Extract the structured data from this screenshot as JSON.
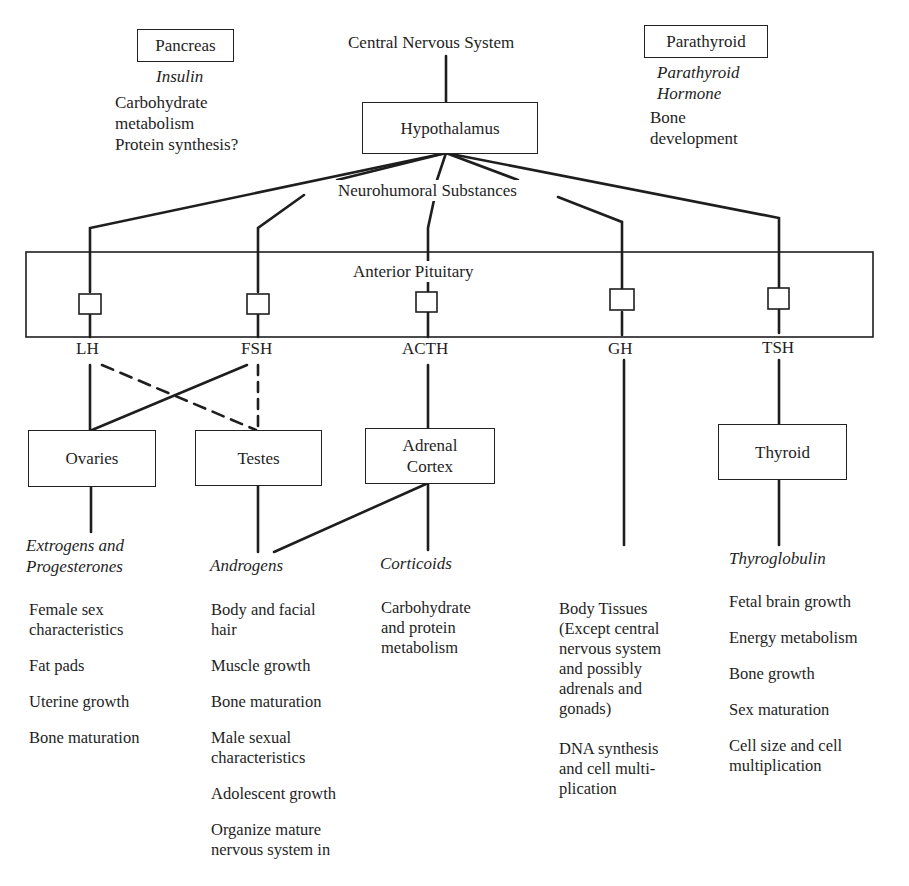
{
  "top": {
    "cns": "Central Nervous System",
    "hypothalamus": "Hypothalamus",
    "neurohumoral": "Neurohumoral Substances",
    "anterior_pituitary": "Anterior Pituitary"
  },
  "pancreas": {
    "box": "Pancreas",
    "hormone": "Insulin",
    "effects": "Carbohydrate\nmetabolism\nProtein synthesis?"
  },
  "parathyroid": {
    "box": "Parathyroid",
    "hormone": "Parathyroid\nHormone",
    "effects": "Bone\ndevelopment"
  },
  "pituitary_hormones": [
    "LH",
    "FSH",
    "ACTH",
    "GH",
    "TSH"
  ],
  "targets": {
    "ovaries": "Ovaries",
    "testes": "Testes",
    "adrenal": "Adrenal\nCortex",
    "thyroid": "Thyroid"
  },
  "products": {
    "ovaries": "Extrogens and\nProgesterones",
    "testes": "Androgens",
    "adrenal": "Corticoids",
    "thyroid": "Thyroglobulin"
  },
  "effects": {
    "ovaries": [
      "Female sex\ncharacteristics",
      "Fat pads",
      "Uterine growth",
      "Bone maturation"
    ],
    "testes": [
      "Body and facial\nhair",
      "Muscle growth",
      "Bone maturation",
      "Male sexual\ncharacteristics",
      "Adolescent growth",
      "Organize mature\nnervous system in"
    ],
    "adrenal": [
      "Carbohydrate\nand protein\nmetabolism"
    ],
    "gh": [
      "Body Tissues\n(Except central\nnervous system\nand possibly\nadrenals and\ngonads)",
      "DNA synthesis\nand cell multi-\nplication"
    ],
    "thyroid": [
      "Fetal brain growth",
      "Energy metabolism",
      "Bone growth",
      "Sex maturation",
      "Cell size and cell\nmultiplication"
    ]
  }
}
